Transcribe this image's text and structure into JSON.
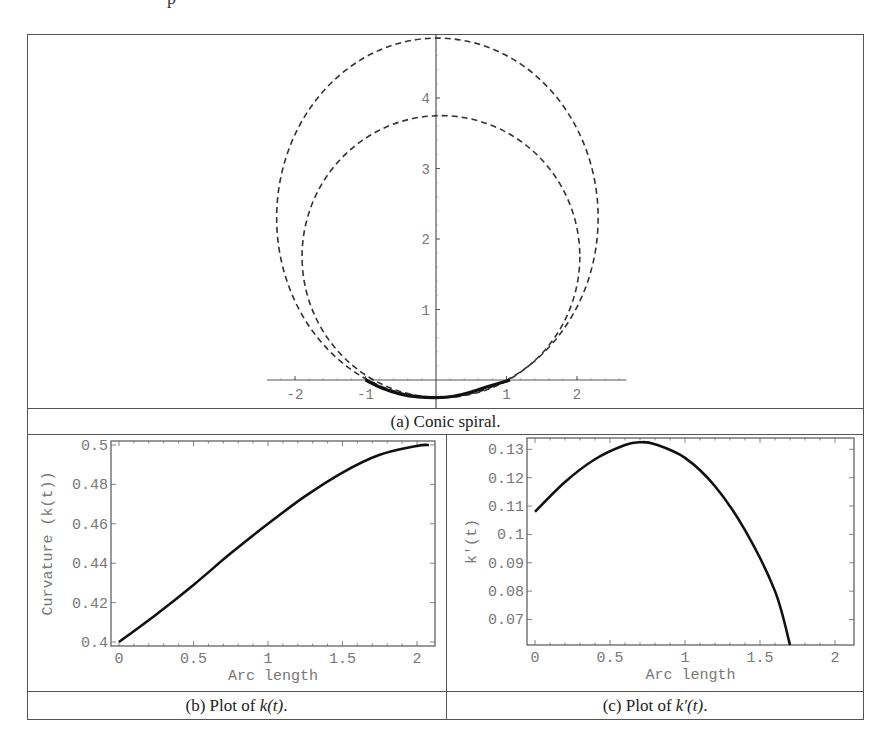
{
  "figure": {
    "top_partial_text": "p",
    "captions": {
      "a": "(a) Conic spiral.",
      "b_prefix": "(b) Plot of ",
      "b_math": "k(t)",
      "b_suffix": ".",
      "c_prefix": "(c) Plot of ",
      "c_math": "k′(t)",
      "c_suffix": "."
    }
  },
  "chart_data": [
    {
      "id": "a",
      "type": "line",
      "title": "(a) Conic spiral.",
      "xlabel": "",
      "ylabel": "",
      "x_ticks": [
        "-2",
        "-1",
        "1",
        "2"
      ],
      "y_ticks": [
        "1",
        "2",
        "3",
        "4"
      ],
      "xlim": [
        -2.35,
        2.7
      ],
      "ylim": [
        -0.3,
        4.95
      ],
      "grid": false,
      "series": [
        {
          "name": "outer dashed osculating conic",
          "style": "dashed",
          "center": [
            0.02,
            2.3
          ],
          "semi_axes": [
            2.28,
            2.55
          ]
        },
        {
          "name": "inner dashed osculating conic",
          "style": "dashed",
          "center": [
            0.07,
            1.75
          ],
          "semi_axes": [
            1.97,
            2.0
          ]
        },
        {
          "name": "conic spiral (solid)",
          "style": "solid",
          "x": [
            -1.0,
            -0.75,
            -0.5,
            -0.25,
            0.0,
            0.25,
            0.5,
            0.75,
            1.05
          ],
          "y": [
            0.0,
            -0.12,
            -0.2,
            -0.24,
            -0.25,
            -0.23,
            -0.17,
            -0.09,
            0.0
          ]
        }
      ]
    },
    {
      "id": "b",
      "type": "line",
      "title": "(b) Plot of k(t).",
      "xlabel": "Arc length",
      "ylabel": "Curvature (k(t))",
      "x_ticks": [
        "0",
        "0.5",
        "1",
        "1.5",
        "2"
      ],
      "y_ticks": [
        "0.4",
        "0.42",
        "0.44",
        "0.46",
        "0.48",
        "0.5"
      ],
      "xlim": [
        -0.05,
        2.12
      ],
      "ylim": [
        0.398,
        0.502
      ],
      "grid": false,
      "x": [
        0.0,
        0.25,
        0.5,
        0.75,
        1.0,
        1.25,
        1.5,
        1.75,
        2.0,
        2.08
      ],
      "values": [
        0.4,
        0.414,
        0.429,
        0.445,
        0.46,
        0.474,
        0.486,
        0.495,
        0.4995,
        0.5
      ]
    },
    {
      "id": "c",
      "type": "line",
      "title": "(c) Plot of k′(t).",
      "xlabel": "Arc length",
      "ylabel": "k′(t)",
      "x_ticks": [
        "0",
        "0.5",
        "1",
        "1.5",
        "2"
      ],
      "y_ticks": [
        "0.07",
        "0.08",
        "0.09",
        "0.1",
        "0.11",
        "0.12",
        "0.13"
      ],
      "xlim": [
        -0.05,
        2.12
      ],
      "ylim": [
        0.061,
        0.134
      ],
      "grid": false,
      "x": [
        0.0,
        0.2,
        0.4,
        0.6,
        0.7,
        0.8,
        1.0,
        1.2,
        1.4,
        1.6,
        1.7
      ],
      "values": [
        0.108,
        0.1185,
        0.1265,
        0.1315,
        0.1325,
        0.1318,
        0.127,
        0.117,
        0.1015,
        0.08,
        0.061
      ]
    }
  ]
}
